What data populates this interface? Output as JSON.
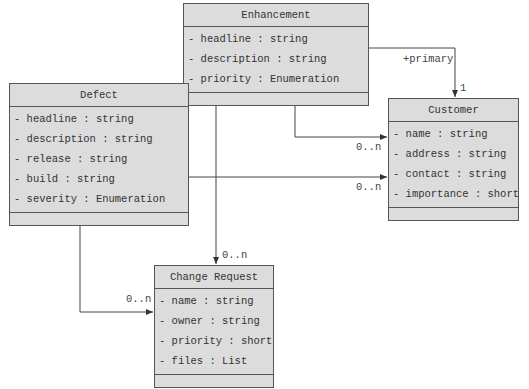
{
  "classes": {
    "enhancement": {
      "name": "Enhancement",
      "attributes": [
        "- headline : string",
        "- description : string",
        "- priority : Enumeration"
      ]
    },
    "defect": {
      "name": "Defect",
      "attributes": [
        "- headline : string",
        "- description : string",
        "- release : string",
        "- build : string",
        "- severity : Enumeration"
      ]
    },
    "customer": {
      "name": "Customer",
      "attributes": [
        "- name : string",
        "- address : string",
        "- contact : string",
        "- importance : short"
      ]
    },
    "change_request": {
      "name": "Change Request",
      "attributes": [
        "- name : string",
        "- owner : string",
        "- priority : short",
        "- files : List"
      ]
    }
  },
  "associations": {
    "enh_cust_primary": {
      "role": "+primary",
      "multiplicity": "1"
    },
    "enh_cust": {
      "multiplicity": "0..n"
    },
    "defect_cust": {
      "multiplicity": "0..n"
    },
    "enh_cr": {
      "multiplicity": "0..n"
    },
    "defect_cr": {
      "multiplicity": "0..n"
    }
  },
  "colors": {
    "box_fill": "#dcdcdc",
    "border": "#555555",
    "line": "#444444"
  }
}
